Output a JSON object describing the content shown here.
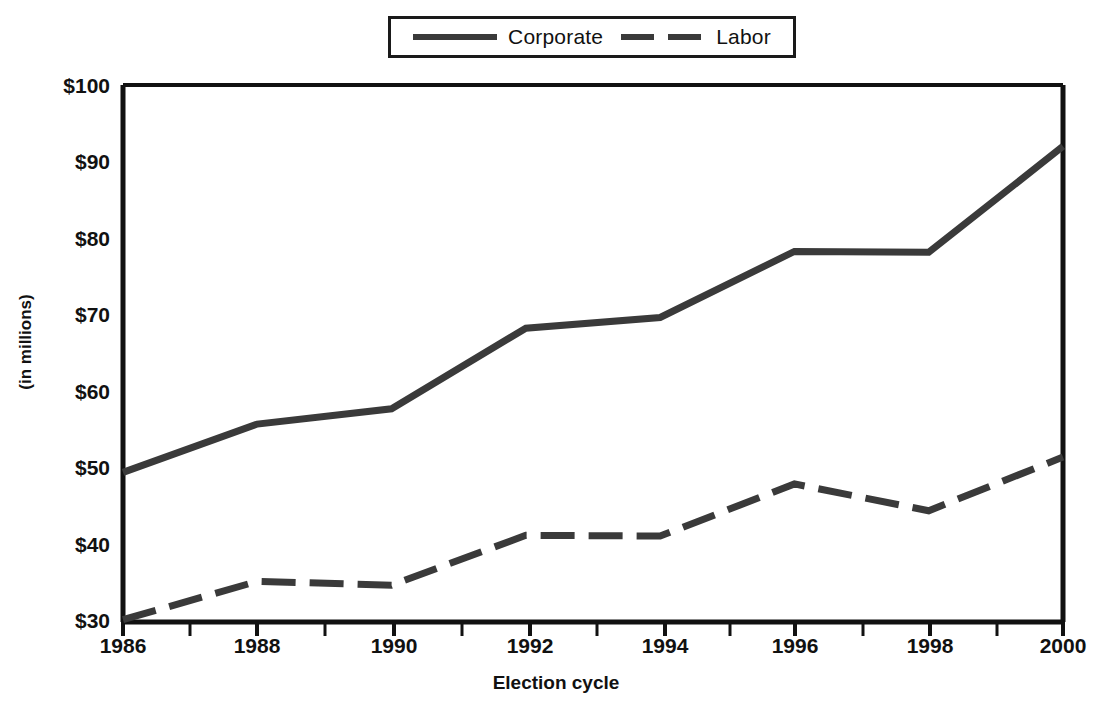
{
  "chart_data": {
    "type": "line",
    "title": "",
    "xlabel": "Election cycle",
    "ylabel": "(in millions)",
    "categories": [
      "1986",
      "1988",
      "1990",
      "1992",
      "1994",
      "1996",
      "1998",
      "2000"
    ],
    "x": [
      1986,
      1988,
      1990,
      1992,
      1994,
      1996,
      1998,
      2000
    ],
    "series": [
      {
        "name": "Corporate",
        "style": "solid",
        "color": "#3a3a3a",
        "values": [
          49.5,
          55.8,
          57.8,
          68.3,
          69.7,
          78.3,
          78.2,
          92.0
        ]
      },
      {
        "name": "Labor",
        "style": "dashed",
        "color": "#3a3a3a",
        "values": [
          30.3,
          35.3,
          34.8,
          41.3,
          41.2,
          48.0,
          44.5,
          51.5
        ]
      }
    ],
    "ylim": [
      30,
      100
    ],
    "xlim": [
      1986,
      2000
    ],
    "ytick_labels": [
      "$100",
      "$90",
      "$80",
      "$70",
      "$60",
      "$50",
      "$40",
      "$30"
    ],
    "ytick_values": [
      100,
      90,
      80,
      70,
      60,
      50,
      40,
      30
    ],
    "xtick_labels": [
      "1986",
      "1988",
      "1990",
      "1992",
      "1994",
      "1996",
      "1998",
      "2000"
    ],
    "grid": false,
    "legend_position": "top-center"
  },
  "legend": {
    "entries": [
      {
        "label": "Corporate",
        "swatch": "solid-line-swatch"
      },
      {
        "label": "Labor",
        "swatch": "dashed-line-swatch"
      }
    ]
  },
  "axes": {
    "y_title": "(in millions)",
    "x_title": "Election cycle",
    "y_ticks": [
      "$100",
      "$90",
      "$80",
      "$70",
      "$60",
      "$50",
      "$40",
      "$30"
    ],
    "x_ticks": [
      "1986",
      "1988",
      "1990",
      "1992",
      "1994",
      "1996",
      "1998",
      "2000"
    ]
  }
}
